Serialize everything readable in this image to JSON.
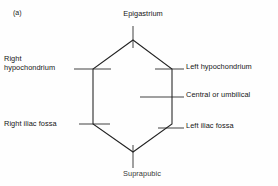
{
  "figure": {
    "panel_tag": "(a)",
    "caption_note": "Regions of the abdomen",
    "shape": "hexagon",
    "line_color": "#222222",
    "background_color": "#fefefe"
  },
  "labels": {
    "epigastrium": "Epigastrium",
    "right_hypochondrium_line1": "Right",
    "right_hypochondrium_line2": "hypochondrium",
    "left_hypochondrium": "Left hypochondrium",
    "central_or_umbilical": "Central or umbilical",
    "right_iliac_fossa": "Right iliac fossa",
    "left_iliac_fossa": "Left iliac fossa",
    "suprapubic": "Suprapubic"
  },
  "regions": [
    {
      "id": "epigastrium",
      "name": "Epigastrium",
      "side": "top",
      "label_position": "above"
    },
    {
      "id": "right-hypochondrium",
      "name": "Right hypochondrium",
      "side": "upper-left",
      "label_position": "left"
    },
    {
      "id": "left-hypochondrium",
      "name": "Left hypochondrium",
      "side": "upper-right",
      "label_position": "right"
    },
    {
      "id": "central-umbilical",
      "name": "Central or umbilical",
      "side": "middle",
      "label_position": "right"
    },
    {
      "id": "right-iliac-fossa",
      "name": "Right iliac fossa",
      "side": "lower-left",
      "label_position": "left"
    },
    {
      "id": "left-iliac-fossa",
      "name": "Left iliac fossa",
      "side": "lower-right",
      "label_position": "right"
    },
    {
      "id": "suprapubic",
      "name": "Suprapubic",
      "side": "bottom",
      "label_position": "below"
    }
  ],
  "geometry": {
    "hexagon_vertices": [
      [
        133,
        40
      ],
      [
        172,
        69
      ],
      [
        172,
        124
      ],
      [
        133,
        152
      ],
      [
        93,
        124
      ],
      [
        93,
        69
      ]
    ],
    "leader_lines": [
      {
        "for": "epigastrium",
        "x1": 133,
        "y1": 26,
        "x2": 133,
        "y2": 48
      },
      {
        "for": "right-hypochondrium",
        "x1": 74,
        "y1": 69,
        "x2": 111,
        "y2": 69
      },
      {
        "for": "left-hypochondrium",
        "x1": 155,
        "y1": 69,
        "x2": 184,
        "y2": 69
      },
      {
        "for": "central-umbilical",
        "x1": 140,
        "y1": 97,
        "x2": 184,
        "y2": 97
      },
      {
        "for": "right-iliac-fossa",
        "x1": 79,
        "y1": 124,
        "x2": 110,
        "y2": 124
      },
      {
        "for": "left-iliac-fossa",
        "x1": 158,
        "y1": 128,
        "x2": 184,
        "y2": 128
      },
      {
        "for": "suprapubic",
        "x1": 133,
        "y1": 145,
        "x2": 133,
        "y2": 168
      }
    ]
  }
}
